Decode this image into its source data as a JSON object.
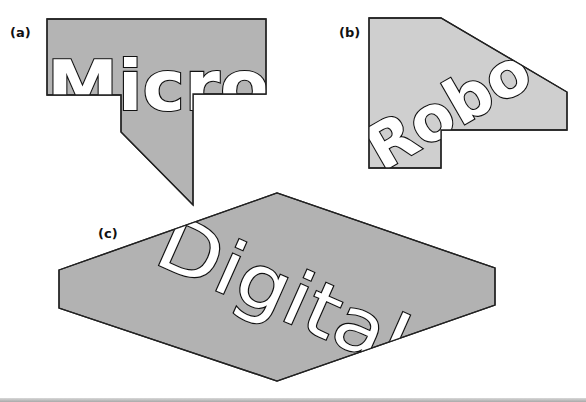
{
  "figure": {
    "panels": [
      {
        "id": "a",
        "label": "(a)",
        "word": "Micro",
        "fill": "#b4b4b4",
        "stroke": "#222222",
        "text_rotation_deg": 0,
        "description": "Rectangle with downward stem and slanted bottom; word clipped at polygon baseline"
      },
      {
        "id": "b",
        "label": "(b)",
        "word": "Robo",
        "fill": "#cfcfcf",
        "stroke": "#222222",
        "text_rotation_deg": -30,
        "description": "Stepped polygon with chamfered top-right corner; rotated word clipped by outline"
      },
      {
        "id": "c",
        "label": "(c)",
        "word": "Digital",
        "fill": "#b2b2b2",
        "stroke": "#222222",
        "text_rotation_deg": 24,
        "description": "Elongated hexagon; word rotated downward and clipped by lower edge"
      }
    ],
    "text_fill": "#ffffff",
    "text_stroke": "#111111"
  }
}
